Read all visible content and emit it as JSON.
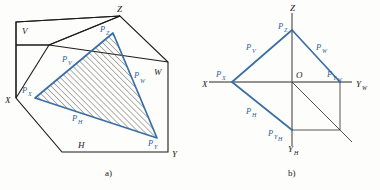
{
  "figure": {
    "background_color": "#fdfdfc",
    "trace_color": "#3a6ea5",
    "outline_color": "#1b1b1b",
    "axis_color": "#6e6e6e",
    "hatch_color": "#4a4a4a"
  },
  "panel_a": {
    "caption": "a)",
    "plane_labels": {
      "v": "V",
      "w": "W",
      "h": "H"
    },
    "axis_labels": {
      "x": "X",
      "y": "Y",
      "z": "Z"
    },
    "trace_point_labels": {
      "px": "P",
      "px_sub": "X",
      "py": "P",
      "py_sub": "Y",
      "pz": "P",
      "pz_sub": "Z"
    },
    "trace_line_labels": {
      "pv": "P",
      "pv_sub": "V",
      "pw": "P",
      "pw_sub": "W",
      "ph": "P",
      "ph_sub": "H"
    },
    "geometry": {
      "origin": [
        49,
        45
      ],
      "x_vertex": [
        16,
        98
      ],
      "y_vertex": [
        172,
        152
      ],
      "z_vertex": [
        120,
        16
      ],
      "w_corner": [
        168,
        62
      ],
      "h_corner": [
        62,
        152
      ],
      "v_corner": [
        16,
        22
      ],
      "trace_px": [
        35,
        98
      ],
      "trace_pz": [
        113,
        33
      ],
      "trace_py": [
        157,
        138
      ]
    }
  },
  "panel_b": {
    "caption": "b)",
    "axis_labels": {
      "x": "X",
      "z": "Z",
      "yw": "Y",
      "yw_sub": "W",
      "yh": "Y",
      "yh_sub": "H"
    },
    "origin_label": "O",
    "trace_point_labels": {
      "px": "P",
      "px_sub": "X",
      "pz": "P",
      "pz_sub": "Z",
      "pyw": "P",
      "pyw_sub": "Y",
      "pyw_sub2": "W",
      "pyh": "P",
      "pyh_sub": "Y",
      "pyh_sub2": "H"
    },
    "trace_line_labels": {
      "pv": "P",
      "pv_sub": "V",
      "pw": "P",
      "pw_sub": "W",
      "ph": "P",
      "ph_sub": "H"
    },
    "geometry": {
      "origin": [
        292,
        82
      ],
      "px": [
        232,
        82
      ],
      "pz": [
        292,
        30
      ],
      "pyw": [
        340,
        82
      ],
      "pyh": [
        292,
        130
      ],
      "axis_x_end": [
        209,
        82
      ],
      "axis_yw_end": [
        352,
        82
      ],
      "axis_z_end": [
        292,
        13
      ],
      "axis_yh_end": [
        292,
        146
      ],
      "bisector_end": [
        352,
        142
      ]
    }
  }
}
